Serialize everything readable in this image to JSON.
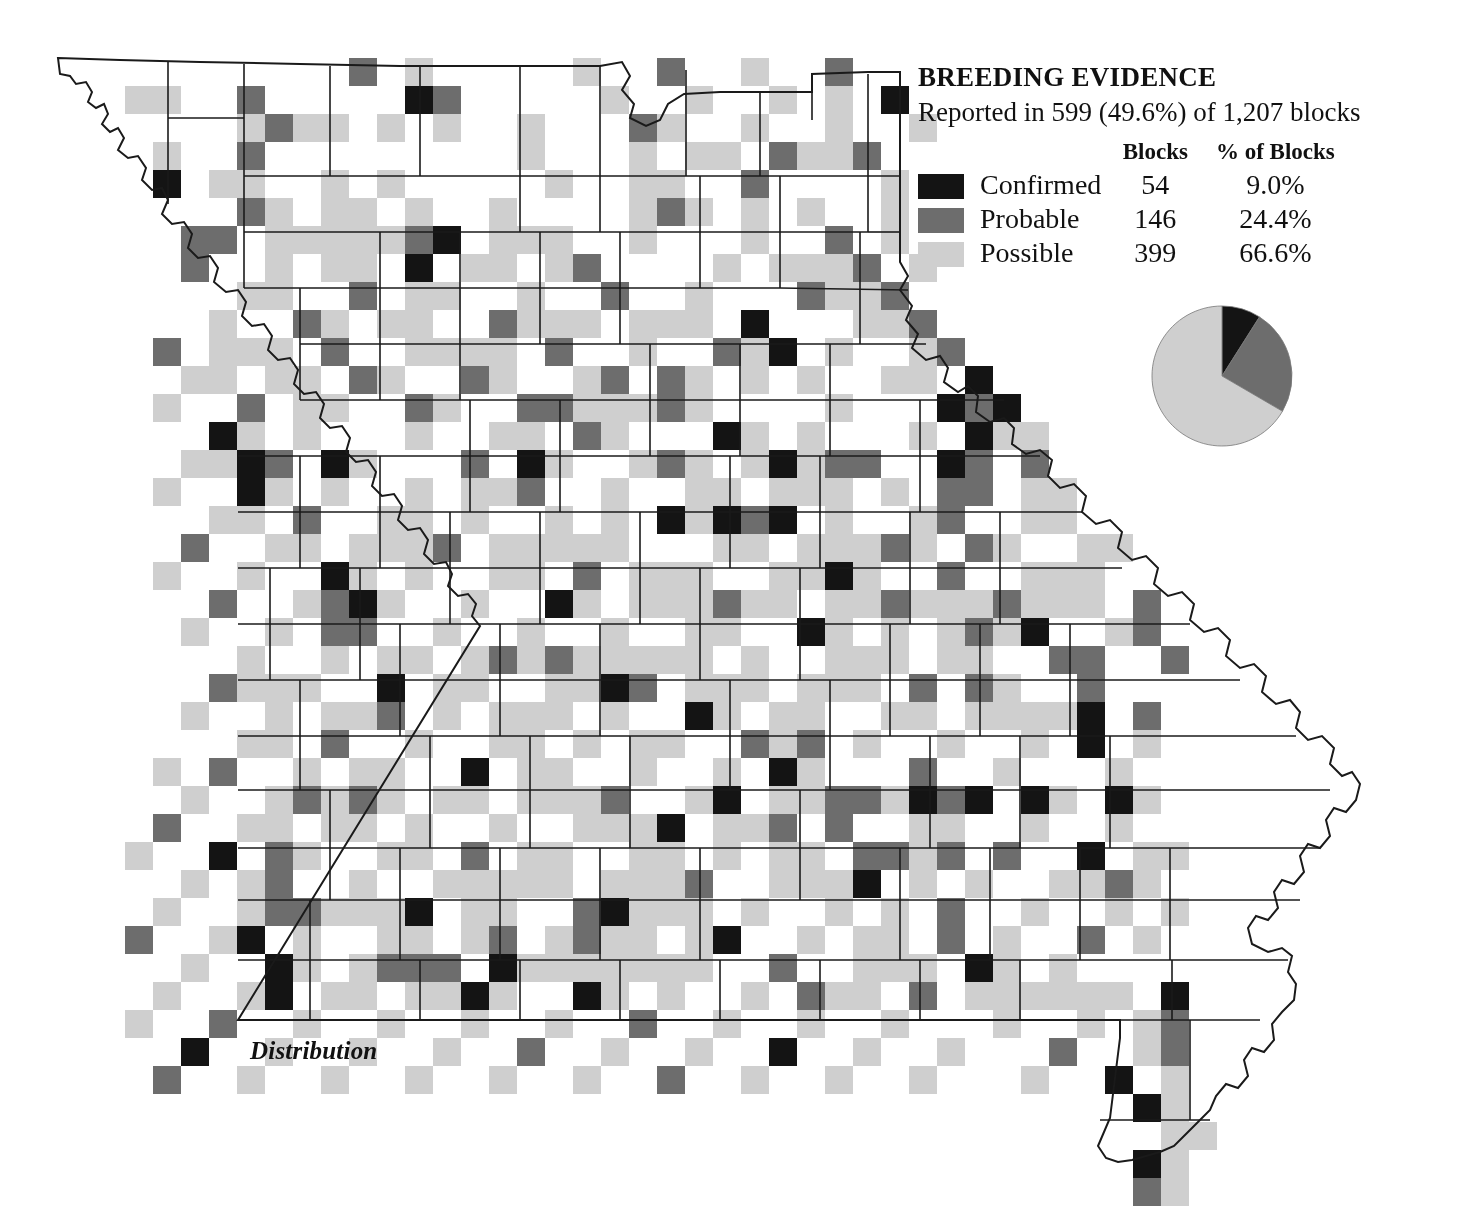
{
  "caption": "Distribution",
  "legend": {
    "title": "BREEDING EVIDENCE",
    "subtitle": "Reported in 599 (49.6%) of 1,207 blocks",
    "col_blocks": "Blocks",
    "col_pct": "% of Blocks",
    "rows": [
      {
        "label": "Confirmed",
        "blocks": "54",
        "pct": "9.0%",
        "color": "#141414"
      },
      {
        "label": "Probable",
        "blocks": "146",
        "pct": "24.4%",
        "color": "#6d6d6d"
      },
      {
        "label": "Possible",
        "blocks": "399",
        "pct": "66.6%",
        "color": "#cfcfcf"
      }
    ]
  },
  "colors": {
    "confirmed": "#141414",
    "probable": "#6d6d6d",
    "possible": "#cfcfcf",
    "outline": "#1a1a1a",
    "background": "#ffffff"
  },
  "chart_data": {
    "type": "pie",
    "title": "BREEDING EVIDENCE",
    "labels": [
      "Confirmed",
      "Probable",
      "Possible"
    ],
    "values": [
      54,
      146,
      399
    ],
    "percents": [
      9.0,
      24.4,
      66.6
    ],
    "colors": [
      "#141414",
      "#6d6d6d",
      "#cfcfcf"
    ],
    "total_reported": 599,
    "total_blocks": 1207,
    "reported_percent": 49.6,
    "start_angle_deg": 0,
    "direction": "clockwise",
    "legend_position": "above"
  },
  "map": {
    "name": "missouri-breeding-evidence-distribution",
    "grid": {
      "cell_w": 28,
      "cell_h": 28,
      "origin_x": 69,
      "origin_y": 58
    },
    "state_outline": "M 58,58 L 60,72 L 70,73 L 76,80 L 84,79 L 90,86 L 87,95 L 93,100 L 100,97 L 104,104 L 99,112 L 106,118 L 112,115 L 118,124 L 113,133 L 122,140 L 131,138 L 140,150 L 136,160 L 145,168 L 155,166 L 162,176 L 158,188 L 168,196 L 178,194 L 186,204 L 182,216 L 192,224 L 204,222 L 214,232 L 210,244 L 222,252 L 234,250 L 244,262 L 240,274 L 250,284 L 262,281 L 272,292 L 268,305 L 278,314 L 292,312 L 300,322 L 296,334 L 306,344 L 318,342 L 328,352 L 324,366 L 334,376 L 346,374 L 356,384 L 352,398 L 364,408 L 378,406 L 388,416 L 384,430 L 396,440 L 410,438 L 420,448 L 416,462 L 428,472 L 442,470 L 452,480 L 448,492 L 460,502 L 474,500 L 484,510 L 482,524 L 492,534 L 506,532 L 516,542 L 514,556 L 524,566 L 538,564 L 548,574 L 546,588 L 238,1020 L 1040,1020 Z"
  }
}
